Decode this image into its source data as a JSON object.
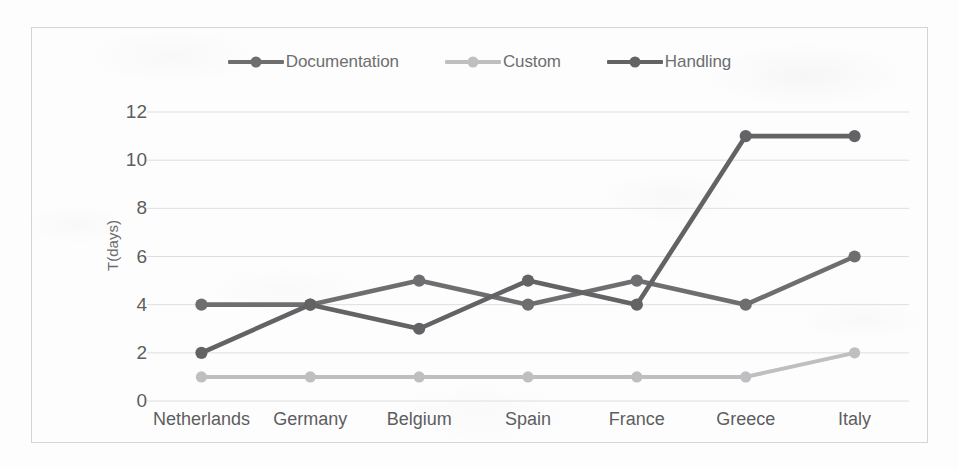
{
  "chart_data": {
    "type": "line",
    "title": "",
    "xlabel": "",
    "ylabel": "T(days)",
    "categories": [
      "Netherlands",
      "Germany",
      "Belgium",
      "Spain",
      "France",
      "Greece",
      "Italy"
    ],
    "ylim": [
      0,
      12
    ],
    "yticks": [
      0,
      2,
      4,
      6,
      8,
      10,
      12
    ],
    "grid": true,
    "legend_position": "top-center",
    "series": [
      {
        "name": "Documentation",
        "color": "#6e6e70",
        "marker": "circle",
        "values": [
          4,
          4,
          5,
          4,
          5,
          4,
          6
        ]
      },
      {
        "name": "Custom",
        "color": "#bfbfc1",
        "marker": "circle",
        "values": [
          1,
          1,
          1,
          1,
          1,
          1,
          2
        ]
      },
      {
        "name": "Handling",
        "color": "#636365",
        "marker": "circle",
        "values": [
          2,
          4,
          3,
          5,
          4,
          11,
          11
        ]
      }
    ]
  },
  "axes": {
    "y_tick_labels": [
      "12",
      "10",
      "8",
      "6",
      "4",
      "2",
      "0"
    ]
  },
  "style": {
    "frame_color": "#d4d4d6",
    "grid_color": "#dedee0",
    "tick_text_color": "#5d5d5f",
    "legend_text_color": "#6e6e70",
    "background": "#fdfdfd"
  }
}
